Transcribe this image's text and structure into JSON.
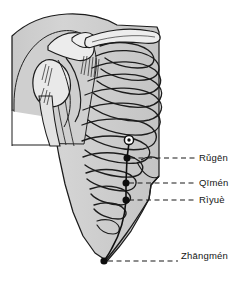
{
  "figure": {
    "background_color": "#ffffff",
    "ink_color": "#141414",
    "skin_fill": "#d0d0d0",
    "bone_fill": "#e8e8e8",
    "width": 246,
    "height": 288
  },
  "points": [
    {
      "id": "nipple",
      "label": "",
      "marker": "circle-open",
      "x": 129,
      "y": 141,
      "has_leader": false
    },
    {
      "id": "st18",
      "label": "Rǔgēn",
      "marker": "dot",
      "x": 127,
      "y": 158,
      "has_leader": true,
      "leader_x2": 196,
      "leader_y2": 158
    },
    {
      "id": "lr14",
      "label": "Qīmén",
      "marker": "dot",
      "x": 126,
      "y": 183,
      "has_leader": true,
      "leader_x2": 196,
      "leader_y2": 183
    },
    {
      "id": "gb24",
      "label": "Rìyuè",
      "marker": "dot",
      "x": 126,
      "y": 200,
      "has_leader": true,
      "leader_x2": 196,
      "leader_y2": 200
    },
    {
      "id": "lr13",
      "label": "Zhāngmén",
      "marker": "dot",
      "x": 104,
      "y": 261,
      "has_leader": true,
      "leader_x2": 179,
      "leader_y2": 261
    }
  ],
  "labels": {
    "rugen": "Rǔgēn",
    "qimen": "Qīmén",
    "riyue": "Rìyuè",
    "zhangmen": "Zhāngmén"
  }
}
